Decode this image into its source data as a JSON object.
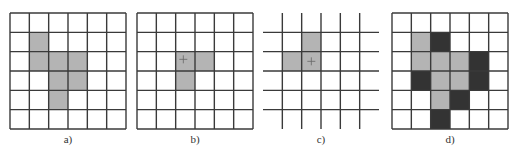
{
  "figure": {
    "grid_size": 6,
    "colors": {
      "line": "#3a3a3a",
      "gray": "#b4b4b4",
      "dark": "#333333",
      "background": "#ffffff"
    },
    "panels": [
      {
        "id": "a",
        "label": "a)",
        "left": 10,
        "style": "bordered",
        "gray_cells": [
          [
            1,
            1
          ],
          [
            2,
            1
          ],
          [
            2,
            2
          ],
          [
            2,
            3
          ],
          [
            3,
            2
          ],
          [
            3,
            3
          ],
          [
            4,
            2
          ]
        ],
        "dark_cells": [],
        "marker": null
      },
      {
        "id": "b",
        "label": "b)",
        "left": 137,
        "style": "bordered",
        "gray_cells": [
          [
            2,
            2
          ],
          [
            2,
            3
          ],
          [
            3,
            2
          ]
        ],
        "dark_cells": [],
        "marker": [
          2,
          2
        ]
      },
      {
        "id": "c",
        "label": "c)",
        "left": 263,
        "style": "interior-lines",
        "gray_cells": [
          [
            1,
            1
          ],
          [
            2,
            0
          ],
          [
            2,
            1
          ]
        ],
        "dark_cells": [],
        "marker": [
          2,
          1
        ]
      },
      {
        "id": "d",
        "label": "d)",
        "left": 392,
        "style": "bordered",
        "gray_cells": [
          [
            1,
            1
          ],
          [
            2,
            1
          ],
          [
            2,
            2
          ],
          [
            2,
            3
          ],
          [
            3,
            2
          ],
          [
            3,
            3
          ],
          [
            4,
            2
          ]
        ],
        "dark_cells": [
          [
            1,
            2
          ],
          [
            2,
            4
          ],
          [
            3,
            1
          ],
          [
            3,
            4
          ],
          [
            4,
            3
          ],
          [
            5,
            2
          ]
        ],
        "marker": null
      }
    ]
  }
}
